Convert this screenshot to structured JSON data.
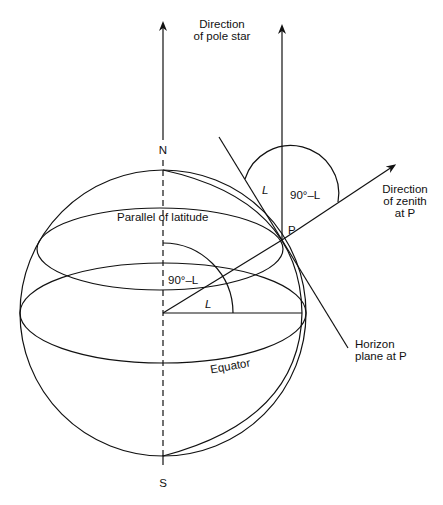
{
  "diagram": {
    "labels": {
      "pole_star_line1": "Direction",
      "pole_star_line2": "of pole star",
      "north": "N",
      "south": "S",
      "parallel": "Parallel of latitude",
      "equator": "Equator",
      "point": "P",
      "zenith_line1": "Direction",
      "zenith_line2": "of zenith",
      "zenith_line3": "at P",
      "horizon_line1": "Horizon",
      "horizon_line2": "plane at P",
      "angle_L_top": "L",
      "angle_90_top": "90°–L",
      "angle_90_center": "90°–L",
      "angle_L_center": "L"
    },
    "colors": {
      "ink": "#111111",
      "background": "#ffffff"
    }
  }
}
